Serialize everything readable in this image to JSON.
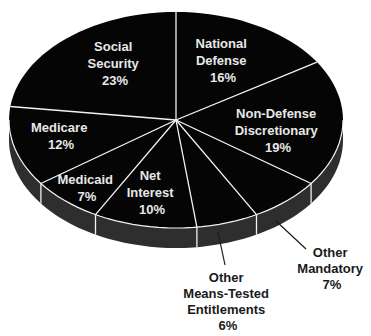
{
  "chart_data": {
    "type": "pie",
    "title": "",
    "style": "3d-tilted",
    "start_angle_deg": 0,
    "direction": "clockwise",
    "categories": [
      "National Defense",
      "Non-Defense Discretionary",
      "Other Mandatory",
      "Other Means-Tested Entitlements",
      "Net Interest",
      "Medicaid",
      "Medicare",
      "Social Security"
    ],
    "values": [
      16,
      19,
      7,
      6,
      10,
      7,
      12,
      23
    ],
    "unit": "%",
    "colors": {
      "top": "#050505",
      "side": "#2e2e2e",
      "divider": "#f2f2f2",
      "label_inside": "#e8e8e8",
      "label_outside": "#1a1a1a"
    }
  },
  "labels": {
    "national_defense": [
      "National",
      "Defense",
      "16%"
    ],
    "non_defense": [
      "Non-Defense",
      "Discretionary",
      "19%"
    ],
    "other_mandatory": [
      "Other",
      "Mandatory",
      "7%"
    ],
    "other_means_tested": [
      "Other",
      "Means-Tested",
      "Entitlements",
      "6%"
    ],
    "net_interest": [
      "Net",
      "Interest",
      "10%"
    ],
    "medicaid": [
      "Medicaid",
      "7%"
    ],
    "medicare": [
      "Medicare",
      "12%"
    ],
    "social_security": [
      "Social",
      "Security",
      "23%"
    ]
  }
}
